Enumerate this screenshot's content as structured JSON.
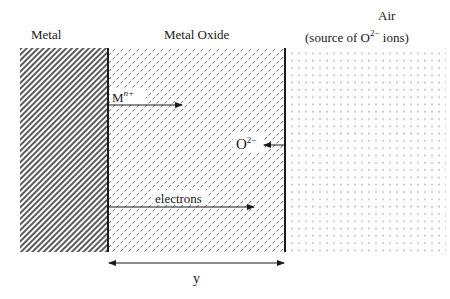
{
  "diagram": {
    "type": "metal-oxidation-schematic",
    "regions": [
      {
        "id": "metal",
        "label": "Metal",
        "pattern": "diagonal-hatch"
      },
      {
        "id": "oxide",
        "label": "Metal Oxide",
        "pattern": "dashed-tiles"
      },
      {
        "id": "air",
        "label_line1": "Air",
        "label_line2_prefix": "(source of O",
        "label_line2_sup": "2−",
        "label_line2_suffix": " ions)",
        "pattern": "dot-grid"
      }
    ],
    "arrows": [
      {
        "id": "metal-ion",
        "label_base": "M",
        "label_sup": "n+",
        "direction": "right"
      },
      {
        "id": "oxygen-ion",
        "label_base": "O",
        "label_sup": "2−",
        "direction": "left"
      },
      {
        "id": "electrons",
        "label": "electrons",
        "direction": "right"
      }
    ],
    "dimension": {
      "label": "y",
      "spans": "oxide thickness"
    }
  },
  "colors": {
    "ink": "#1a1a1a",
    "hatch": "#555555",
    "tile": "#777777",
    "dot": "#8a8a8a",
    "background": "#ffffff"
  }
}
